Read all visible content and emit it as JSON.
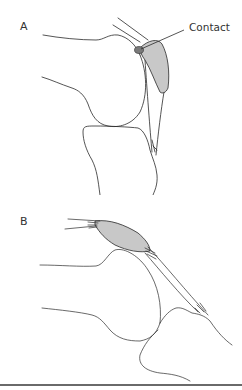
{
  "figure": {
    "panels": [
      {
        "id": "A",
        "label": "A",
        "annotation": "Contact"
      },
      {
        "id": "B",
        "label": "B"
      }
    ],
    "colors": {
      "stroke": "#2a2a2a",
      "fill_shaded": "#c8c8c8",
      "contact_dot": "#7a7a7a",
      "rule": "#6a6a6a"
    }
  }
}
